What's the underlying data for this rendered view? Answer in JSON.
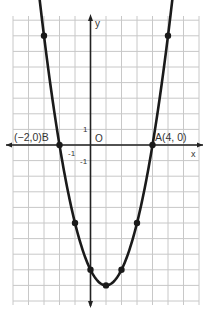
{
  "chart_data": {
    "type": "line",
    "title": "",
    "function": "y = x^2 - 2x - 8",
    "xlabel": "x",
    "ylabel": "y",
    "origin_label": "O",
    "unit_labels": {
      "x_neg": "-1",
      "y_pos": "1",
      "y_neg": "-1"
    },
    "xlim": [
      -5,
      7
    ],
    "ylim": [
      -10,
      8.5
    ],
    "grid": true,
    "points": [
      {
        "x": -3,
        "y": 7
      },
      {
        "x": -2,
        "y": 0
      },
      {
        "x": -1,
        "y": -5
      },
      {
        "x": 0,
        "y": -8
      },
      {
        "x": 1,
        "y": -9
      },
      {
        "x": 2,
        "y": -8
      },
      {
        "x": 3,
        "y": -5
      },
      {
        "x": 4,
        "y": 0
      },
      {
        "x": 5,
        "y": 7
      }
    ],
    "annotations": [
      {
        "label": "(−2,0)B",
        "x": -2,
        "y": 0
      },
      {
        "label": "A(4, 0)",
        "x": 4,
        "y": 0
      }
    ]
  },
  "colors": {
    "curve": "#1a1a1a",
    "grid": "#c8c8c8",
    "axis": "#222222",
    "text": "#333333"
  }
}
